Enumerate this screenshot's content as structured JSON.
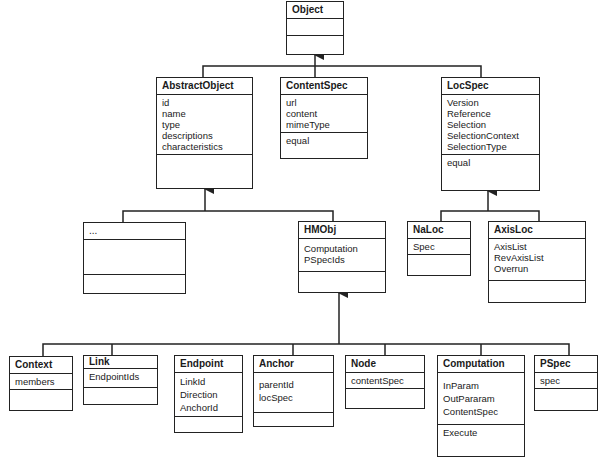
{
  "diagram": {
    "type": "uml-class-diagram",
    "classes": {
      "object": {
        "name": "Object",
        "attributes": [],
        "operations": []
      },
      "abstractObject": {
        "name": "AbstractObject",
        "attributes": [
          "id",
          "name",
          "type",
          "descriptions",
          "characteristics"
        ],
        "operations": []
      },
      "contentSpec": {
        "name": "ContentSpec",
        "attributes": [
          "url",
          "content",
          "mimeType"
        ],
        "operations": [
          "equal"
        ]
      },
      "locSpec": {
        "name": "LocSpec",
        "attributes": [
          "Version",
          "Reference",
          "Selection",
          "SelectionContext",
          "SelectionType"
        ],
        "operations": [
          "equal"
        ]
      },
      "ellipsis": {
        "name": "...",
        "attributes": [],
        "operations": []
      },
      "hmObj": {
        "name": "HMObj",
        "attributes": [
          "Computation",
          "PSpecIds"
        ],
        "operations": []
      },
      "naLoc": {
        "name": "NaLoc",
        "attributes": [
          "Spec"
        ],
        "operations": []
      },
      "axisLoc": {
        "name": "AxisLoc",
        "attributes": [
          "AxisList",
          "RevAxisList",
          "Overrun"
        ],
        "operations": []
      },
      "context": {
        "name": "Context",
        "attributes": [
          "members"
        ],
        "operations": []
      },
      "link": {
        "name": "Link",
        "attributes": [
          "EndpointIds"
        ],
        "operations": []
      },
      "endpoint": {
        "name": "Endpoint",
        "attributes": [
          "LinkId",
          "Direction",
          "AnchorId"
        ],
        "operations": []
      },
      "anchor": {
        "name": "Anchor",
        "attributes": [
          "parentId",
          "locSpec"
        ],
        "operations": []
      },
      "node": {
        "name": "Node",
        "attributes": [
          "contentSpec"
        ],
        "operations": []
      },
      "computation": {
        "name": "Computation",
        "attributes": [
          "InParam",
          "OutPararam",
          "ContentSpec"
        ],
        "operations": [
          "Execute"
        ]
      },
      "pSpec": {
        "name": "PSpec",
        "attributes": [
          "spec"
        ],
        "operations": []
      }
    },
    "inheritance": [
      {
        "parent": "Object",
        "children": [
          "AbstractObject",
          "ContentSpec",
          "LocSpec"
        ]
      },
      {
        "parent": "AbstractObject",
        "children": [
          "...",
          "HMObj"
        ]
      },
      {
        "parent": "LocSpec",
        "children": [
          "NaLoc",
          "AxisLoc"
        ]
      },
      {
        "parent": "HMObj",
        "children": [
          "Context",
          "Link",
          "Endpoint",
          "Anchor",
          "Node",
          "Computation",
          "PSpec"
        ]
      }
    ],
    "colors": {
      "line": "#222222",
      "background": "#ffffff",
      "text": "#1a1a1a"
    }
  }
}
